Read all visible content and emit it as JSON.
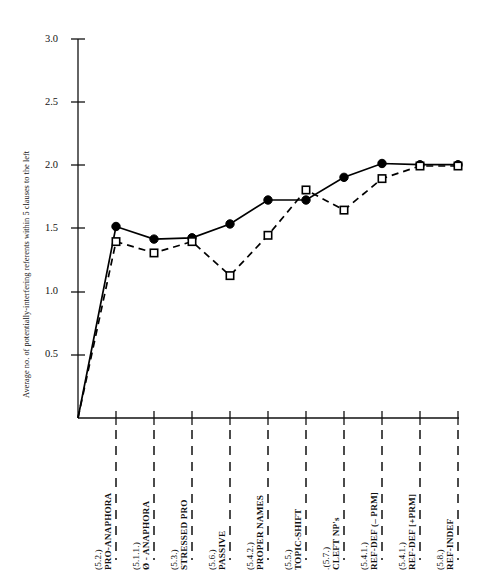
{
  "chart_data": {
    "type": "line",
    "title": "",
    "xlabel": "",
    "ylabel": "Average no. of potentially-interfering referents within 5 clauses to the left",
    "ylim": [
      0,
      3.0
    ],
    "yticks": [
      "0.5",
      "1.0",
      "1.5",
      "2.0",
      "2.5",
      "3.0"
    ],
    "ytick_values": [
      0.5,
      1.0,
      1.5,
      2.0,
      2.5,
      3.0
    ],
    "grid": false,
    "legend": "none",
    "categories": [
      "PRO-ANAPHORA",
      "Ø - ANAPHORA",
      "STRESSED PRO",
      "PASSIVE",
      "PROPER NAMES",
      "TOPIC-SHIFT",
      "CLEFT NP's",
      "REF-DEF (– PRM]",
      "REF-DEF [+PRM]",
      "REF-INDEF"
    ],
    "category_refs": [
      "(5.2.)",
      "(5.1.1.)",
      "(5.3.)",
      "(5.6.)",
      "(5.4.2.)",
      "(5.5.)",
      ".(5.7.)",
      "(5.4.1.)",
      "(5.4.1.)",
      "(5.8.)"
    ],
    "series": [
      {
        "name": "filled-circle-solid",
        "marker": "filled-circle",
        "linestyle": "solid",
        "color": "#000000",
        "origin_value": 0,
        "values": [
          1.52,
          1.42,
          1.43,
          1.54,
          1.73,
          1.73,
          1.91,
          2.02,
          2.01,
          2.01
        ]
      },
      {
        "name": "open-square-dashed",
        "marker": "open-square",
        "linestyle": "dashed",
        "color": "#000000",
        "origin_value": 0,
        "values": [
          1.4,
          1.31,
          1.4,
          1.13,
          1.45,
          1.81,
          1.65,
          1.9,
          2.0,
          2.0
        ]
      }
    ]
  },
  "axes": {
    "y_axis_label": "Average no. of potentially-interfering referents within 5 clauses to the left"
  }
}
